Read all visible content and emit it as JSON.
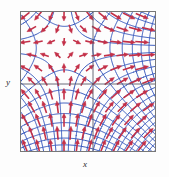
{
  "figure": {
    "kind": "vector-field-plot",
    "background_color": "#fdfdfd",
    "width": 169,
    "height": 177
  },
  "axes": {
    "x_label": "x",
    "y_label": "y",
    "frame": {
      "left": 20,
      "top": 11,
      "right": 156,
      "bottom": 152
    },
    "frame_color": "#777777",
    "interior_axis_color": "#5a5a6a",
    "x_zero_line_y": 84,
    "y_zero_line_x": 93
  },
  "chart_data": {
    "type": "scatter",
    "title": "",
    "xlabel": "x",
    "ylabel": "y",
    "grid": false,
    "legend": null,
    "xlim": [
      -2,
      2
    ],
    "ylim": [
      -2,
      2
    ],
    "series": [
      {
        "name": "level curves",
        "type": "curve-family",
        "color": "#3355bb",
        "stroke_width": 1,
        "count": 34
      },
      {
        "name": "gradient arrows",
        "type": "vector-field",
        "color": "#c33048",
        "stroke_width": 1.6,
        "count": 96,
        "arrowhead": "solid-triangle"
      }
    ],
    "colors": {
      "curves": "#3355bb",
      "arrows": "#c33048",
      "frame": "#777777",
      "axis": "#5a5a6a",
      "background": "#fdfdfd"
    },
    "singular_point": {
      "x": 93,
      "y": 84
    }
  }
}
